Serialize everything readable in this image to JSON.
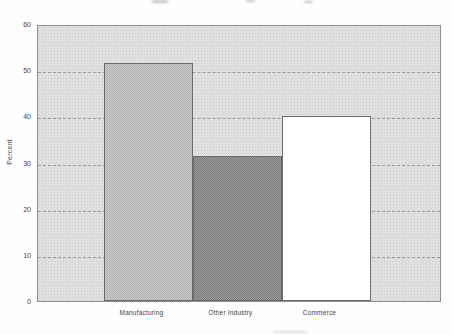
{
  "figure": {
    "background": "#fefefe",
    "plot_background": "#e0e0e0",
    "plot_border_color": "#8f8f8f",
    "grid_color": "#9c9c9c",
    "text_color": "#3d3d3d",
    "title_visible": false
  },
  "chart_data": {
    "type": "bar",
    "title": "",
    "xlabel": "",
    "ylabel": "Percent",
    "categories": [
      "Manufacturing",
      "Other Industry",
      "Commerce"
    ],
    "values": [
      51.5,
      31.5,
      40
    ],
    "ylim": [
      0,
      60
    ],
    "yticks": [
      0,
      10,
      20,
      30,
      40,
      50,
      60
    ],
    "grid": true,
    "legend": false,
    "bar_colors": [
      "#c6c6c6",
      "#8f8f8f",
      "#ffffff"
    ],
    "bar_border_color": "#6b6b6b"
  }
}
